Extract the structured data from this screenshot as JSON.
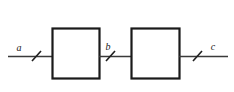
{
  "diagram": {
    "type": "block-diagram",
    "background_color": "#ffffff",
    "line_color": "#3a3a3a",
    "block_border_color": "#1a1a1a",
    "label_color": "#1a1a1a",
    "blocks": [
      {
        "id": "block-1",
        "label": "",
        "x": 52,
        "y": 28,
        "width": 47,
        "height": 50
      },
      {
        "id": "block-2",
        "label": "",
        "x": 131,
        "y": 28,
        "width": 48,
        "height": 50
      }
    ],
    "wires": [
      {
        "id": "wire-a",
        "label": "a",
        "x1": 8,
        "y1": 56,
        "x2": 52,
        "y2": 56,
        "slash_x": 36,
        "label_x": 19,
        "label_y": 51
      },
      {
        "id": "wire-b",
        "label": "b",
        "x1": 99,
        "y1": 56,
        "x2": 131,
        "y2": 56,
        "slash_x": 110,
        "label_x": 108,
        "label_y": 50
      },
      {
        "id": "wire-c",
        "label": "c",
        "x1": 179,
        "y1": 56,
        "x2": 228,
        "y2": 56,
        "slash_x": 197,
        "label_x": 213,
        "label_y": 50
      }
    ],
    "slash_marks": {
      "count": 3,
      "meaning": "bus / multi-conductor tick"
    }
  }
}
